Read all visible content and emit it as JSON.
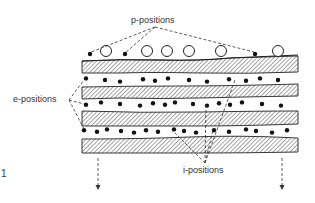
{
  "figure": {
    "number": "1",
    "labels": {
      "p_positions": "p-positions",
      "e_positions": "e-positions",
      "i_positions": "i-positions"
    },
    "colors": {
      "ink": "#1a1a1a",
      "hatch": "#444444",
      "background": "#ffffff"
    },
    "layers": {
      "hatched_layer_count": 4,
      "dot_rows_between_layers": 3
    },
    "surface_particles": {
      "open_circles_x": [
        106,
        147,
        167,
        189,
        221,
        278
      ],
      "filled_dots_x": [
        90,
        125,
        255
      ]
    },
    "rows": [
      {
        "y": 80,
        "dots_x": [
          86,
          105,
          120,
          143,
          155,
          168,
          189,
          207,
          229,
          246,
          260,
          278
        ]
      },
      {
        "y": 104,
        "dots_x": [
          86,
          101,
          120,
          140,
          153,
          165,
          175,
          193,
          207,
          219,
          230,
          242,
          262,
          281
        ]
      },
      {
        "y": 131,
        "dots_x": [
          84,
          97,
          107,
          121,
          134,
          146,
          158,
          174,
          184,
          196,
          214,
          229,
          246,
          256,
          272,
          287
        ]
      }
    ],
    "arrows_down_x": [
      98,
      282
    ]
  }
}
